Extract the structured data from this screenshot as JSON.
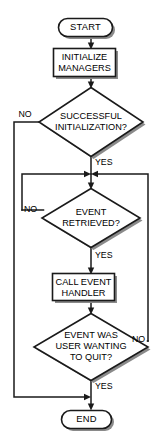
{
  "diagram": {
    "type": "flowchart",
    "colors": {
      "background": "#ffffff",
      "stroke": "#1a1a1a",
      "shadow": "#8a8a8a",
      "text": "#000000"
    },
    "nodes": [
      {
        "id": "start",
        "shape": "terminator",
        "label": "START"
      },
      {
        "id": "initialize-managers",
        "shape": "process",
        "label_line1": "INITIALIZE",
        "label_line2": "MANAGERS"
      },
      {
        "id": "successful-initialization",
        "shape": "decision",
        "label_line1": "SUCCESSFUL",
        "label_line2": "INITIALIZATION?"
      },
      {
        "id": "event-retrieved",
        "shape": "decision",
        "label_line1": "EVENT",
        "label_line2": "RETRIEVED?"
      },
      {
        "id": "call-event-handler",
        "shape": "process",
        "label_line1": "CALL EVENT",
        "label_line2": "HANDLER"
      },
      {
        "id": "event-was-user-wanting-to-quit",
        "shape": "decision",
        "label_line1": "EVENT WAS",
        "label_line2": "USER WANTING",
        "label_line3": "TO QUIT?"
      },
      {
        "id": "end",
        "shape": "terminator",
        "label": "END"
      }
    ],
    "edge_labels": {
      "init_no": "NO",
      "init_yes": "YES",
      "retrieved_no": "NO",
      "retrieved_yes": "YES",
      "quit_no": "NO",
      "quit_yes": "YES"
    }
  }
}
